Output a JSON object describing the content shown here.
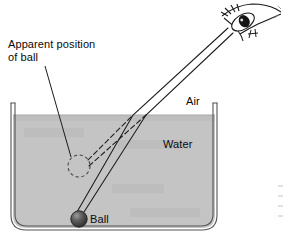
{
  "figure": {
    "background_color": "#ffffff",
    "width": 285,
    "height": 238
  },
  "labels": {
    "apparent_position": "Apparent position\nof ball",
    "air": "Air",
    "water": "Water",
    "ball": "Ball"
  },
  "colors": {
    "water_fill": "#c4c4c4",
    "tank_outline": "#4a4a4a",
    "ray_line": "#1a1a1a",
    "ball_dark": "#3a3a3a",
    "ball_highlight": "#8c8c8c",
    "text": "#0a0a0a",
    "eye_outline": "#1a1a1a",
    "pupil": "#111111"
  },
  "scene": {
    "tank": {
      "left_wall_x": 11,
      "right_wall_x": 217,
      "top_y": 103,
      "bottom_y": 230,
      "corner_radius": 14
    },
    "water_surface_y": 115,
    "ball": {
      "cx": 79,
      "cy": 219,
      "r": 8
    },
    "apparent_ball": {
      "cx": 79,
      "cy": 163,
      "r": 11,
      "style": "dashed"
    },
    "refraction_point": {
      "x": 146,
      "y": 115
    },
    "eye": {
      "cx": 243,
      "cy": 22
    },
    "rays": [
      {
        "name": "real-ray-left",
        "from": "ball",
        "via": "surface",
        "to": "eye",
        "style": "solid"
      },
      {
        "name": "real-ray-right",
        "from": "ball",
        "via": "surface",
        "to": "eye",
        "style": "solid"
      },
      {
        "name": "virtual-ray-upper",
        "from": "apparent-ball",
        "to": "surface",
        "style": "dashed"
      },
      {
        "name": "virtual-ray-lower",
        "from": "apparent-ball",
        "to": "surface",
        "style": "dashed"
      }
    ],
    "leader_line": {
      "from_x": 45,
      "from_y": 66,
      "to_x": 73,
      "to_y": 155
    }
  }
}
